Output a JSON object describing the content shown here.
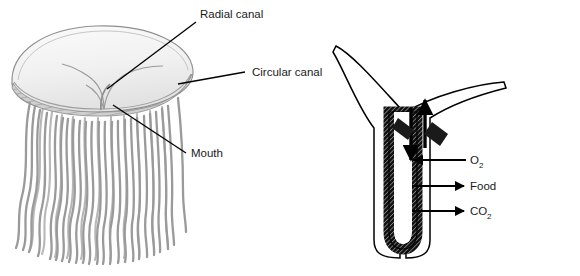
{
  "figure": {
    "background_color": "#ffffff",
    "width": 580,
    "height": 276
  },
  "panels": [
    {
      "id": "jellyfish-whole",
      "name": "Whole jellyfish with bell and tentacles",
      "bell_color": "#f2f2f2",
      "bell_stroke": "#8a8a8a",
      "canal_color": "#9a9a9a",
      "tentacle_color": "#a0a0a0",
      "margin_band_color": "#c8c8c8"
    },
    {
      "id": "gastrovascular-cavity",
      "name": "Cross section of body wall and gastrovascular cavity",
      "wall_fill": "#1a1a1a",
      "wall_stroke": "#000000",
      "outline_stroke": "#000000",
      "arrow_color": "#000000"
    }
  ],
  "labels": {
    "radial_canal": "Radial canal",
    "circular_canal": "Circular canal",
    "mouth": "Mouth",
    "oxygen": "O",
    "oxygen_sub": "2",
    "food": "Food",
    "carbon_dioxide": "CO",
    "carbon_dioxide_sub": "2"
  },
  "arrows": {
    "into_cavity_down": "water flowing down into gastrovascular cavity",
    "out_of_cavity_up": "water flowing up out of gastrovascular cavity",
    "oxygen_direction": "inward",
    "food_direction": "outward",
    "carbon_dioxide_direction": "outward"
  },
  "leader_lines": {
    "radial_canal": "from text down-left to radial canal on bell",
    "circular_canal": "from text left to bell margin ring",
    "mouth": "from text up-left to mouth at bell underside"
  },
  "colors": {
    "text": "#1a1a1a",
    "leader": "#000000",
    "background": "#ffffff"
  }
}
